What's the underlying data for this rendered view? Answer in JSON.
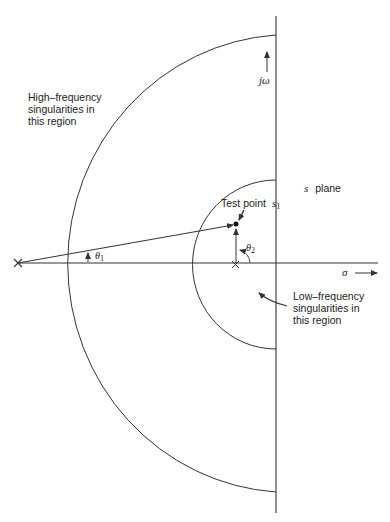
{
  "diagram": {
    "title": "s plane",
    "axes": {
      "horizontal_label": "σ",
      "vertical_label": "jω"
    },
    "points": {
      "test_point_label": "Test point",
      "test_point_symbol": "s",
      "test_point_subscript": "1",
      "far_pole_marker": "×",
      "near_pole_marker": "×"
    },
    "angles": {
      "theta1_symbol": "θ",
      "theta1_subscript": "1",
      "theta2_symbol": "θ",
      "theta2_subscript": "2"
    },
    "regions": {
      "high_frequency": [
        "High–frequency",
        "singularities in",
        "this region"
      ],
      "low_frequency": [
        "Low–frequency",
        "singularities in",
        "this region"
      ]
    },
    "plane_label_symbol": "s",
    "plane_label_text": "plane",
    "colors": {
      "stroke": "#333333",
      "background": "#ffffff"
    }
  }
}
